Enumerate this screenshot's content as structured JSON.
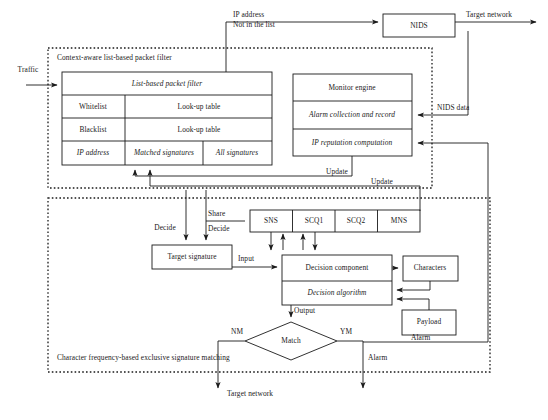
{
  "zones": {
    "upper": "Context-aware list-based packet filter",
    "lower": "Character frequency-based exclusive signature matching"
  },
  "boxes": {
    "nids": "NIDS",
    "list_based_packet_filter": "List-based packet filter",
    "whitelist": "Whitelist",
    "whitelist_table": "Look-up table",
    "blacklist": "Blacklist",
    "blacklist_table": "Look-up table",
    "ip_address": "IP address",
    "matched_signatures": "Matched signatures",
    "all_signatures": "All signatures",
    "monitor_engine": "Monitor engine",
    "alarm_collection": "Alarm collection and record",
    "ip_reputation": "IP reputation computation",
    "sns": "SNS",
    "scq1": "SCQ1",
    "scq2": "SCQ2",
    "mns": "MNS",
    "target_signature": "Target signature",
    "decision_component": "Decision component",
    "decision_algorithm": "Decision algorithm",
    "characters": "Characters",
    "payload": "Payload",
    "match": "Match"
  },
  "edges": {
    "traffic": "Traffic",
    "ip_address_line1": "IP address",
    "ip_address_line2": "Not in the list",
    "target_network_top": "Target network",
    "nids_data": "NIDS data",
    "update_left": "Update",
    "update_right": "Update",
    "share": "Share",
    "decide_left": "Decide",
    "decide_right": "Decide",
    "input": "Input",
    "output": "Output",
    "alarm_right": "Alarm",
    "alarm_bottom": "Alarm",
    "nm": "NM",
    "ym": "YM",
    "target_network_bottom": "Target network"
  },
  "style": {
    "stroke": "#1a1a1a",
    "text": "#1a1a1a",
    "background": "#ffffff"
  }
}
